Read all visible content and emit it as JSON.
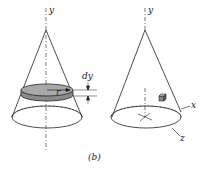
{
  "figure": {
    "caption": "(b)",
    "left_cone": {
      "axis_label": "y",
      "radius_label": "r",
      "thickness_label": "dy",
      "disk_fill": "#a8a8a8"
    },
    "right_cone": {
      "axis_labels": {
        "y": "y",
        "x": "x",
        "z": "z"
      },
      "element": "cube"
    }
  }
}
